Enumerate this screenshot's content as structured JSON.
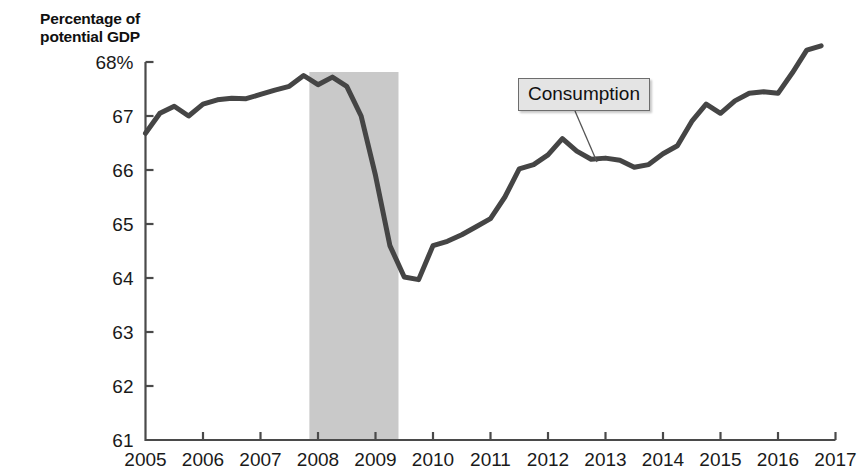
{
  "figure": {
    "axis_title": "Percentage of\npotential GDP",
    "line_color": "#454545",
    "band_color": "#c9c9c9",
    "axis_color": "#4a4a4a",
    "callout_bg": "#e4e4e4",
    "callout_border": "#6d6d6d"
  },
  "annotation": {
    "label": "Consumption",
    "box_left": 518,
    "box_top": 78,
    "leader_from_x": 575,
    "leader_from_y": 111,
    "leader_to_x": 597,
    "leader_to_y": 162
  },
  "chart_data": {
    "type": "line",
    "title": "",
    "xlabel": "",
    "ylabel": "Percentage of potential GDP",
    "xlim": [
      2005,
      2017
    ],
    "ylim": [
      61,
      68.5
    ],
    "grid": false,
    "legend": "none",
    "y_ticks": [
      68,
      67,
      66,
      65,
      64,
      63,
      62,
      61
    ],
    "y_tick_labels": [
      "68%",
      "67",
      "66",
      "65",
      "64",
      "63",
      "62",
      "61"
    ],
    "x_ticks": [
      2005,
      2006,
      2007,
      2008,
      2009,
      2010,
      2011,
      2012,
      2013,
      2014,
      2015,
      2016,
      2017
    ],
    "x_tick_labels": [
      "2005",
      "2006",
      "2007",
      "2008",
      "2009",
      "2010",
      "2011",
      "2012",
      "2013",
      "2014",
      "2015",
      "2016",
      "2017"
    ],
    "shaded_regions": [
      {
        "label": "recession",
        "x_start": 2007.85,
        "x_end": 2009.4,
        "color": "#c9c9c9"
      }
    ],
    "series": [
      {
        "name": "Consumption",
        "color": "#454545",
        "x": [
          2005.0,
          2005.25,
          2005.5,
          2005.75,
          2006.0,
          2006.25,
          2006.5,
          2006.75,
          2007.0,
          2007.25,
          2007.5,
          2007.75,
          2008.0,
          2008.25,
          2008.5,
          2008.75,
          2009.0,
          2009.25,
          2009.5,
          2009.75,
          2010.0,
          2010.25,
          2010.5,
          2010.75,
          2011.0,
          2011.25,
          2011.5,
          2011.75,
          2012.0,
          2012.25,
          2012.5,
          2012.75,
          2013.0,
          2013.25,
          2013.5,
          2013.75,
          2014.0,
          2014.25,
          2014.5,
          2014.75,
          2015.0,
          2015.25,
          2015.5,
          2015.75,
          2016.0,
          2016.25,
          2016.5,
          2016.75
        ],
        "y": [
          66.68,
          67.05,
          67.18,
          67.0,
          67.22,
          67.3,
          67.33,
          67.32,
          67.4,
          67.48,
          67.55,
          67.75,
          67.58,
          67.72,
          67.55,
          67.0,
          65.9,
          64.6,
          64.02,
          63.97,
          64.6,
          64.68,
          64.8,
          64.95,
          65.1,
          65.5,
          66.02,
          66.1,
          66.28,
          66.58,
          66.35,
          66.2,
          66.22,
          66.18,
          66.05,
          66.1,
          66.3,
          66.45,
          66.9,
          67.22,
          67.05,
          67.28,
          67.42,
          67.45,
          67.42,
          67.8,
          68.22,
          68.3
        ]
      }
    ]
  }
}
